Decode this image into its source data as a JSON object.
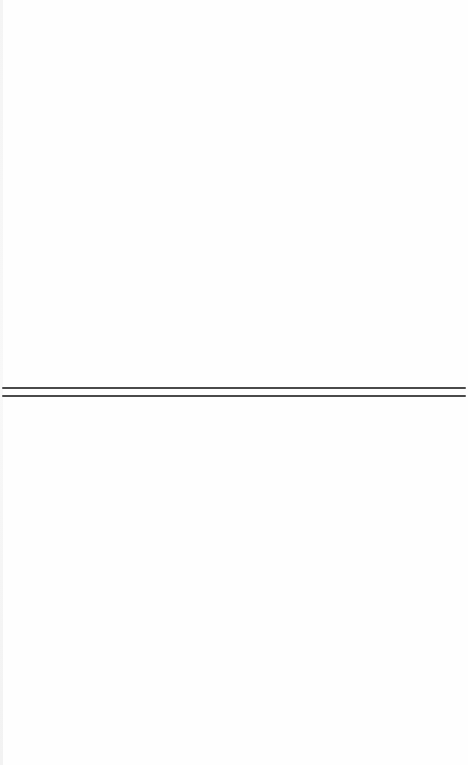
{
  "page": {
    "background": "#fefefe",
    "left_edge_color": "#f4f4f4"
  },
  "divider": {
    "style": "double-rule",
    "color": "#4a4a4a",
    "lines": [
      {
        "y": 387,
        "x_start": 2,
        "x_end": 466,
        "thickness": 2
      },
      {
        "y": 395,
        "x_start": 2,
        "x_end": 466,
        "thickness": 2
      }
    ]
  }
}
